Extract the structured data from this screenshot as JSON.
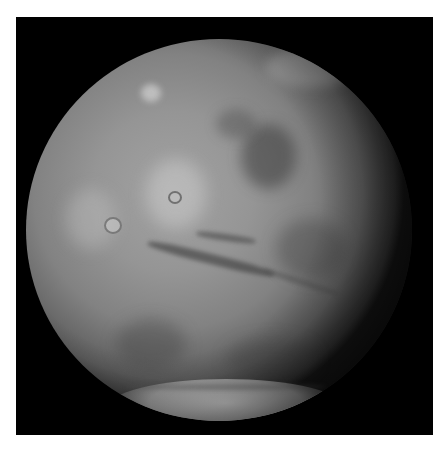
{
  "image": {
    "subject": "Mars full-disk view",
    "colors": {
      "frame_border": "#ffffff",
      "space_background": "#000000",
      "surface_mid": "#959595",
      "polar_cap": "#d7d7d7"
    },
    "features": [
      "tharsis-volcanoes",
      "valles-marineris",
      "south-polar-cap",
      "northern-clouds"
    ]
  }
}
